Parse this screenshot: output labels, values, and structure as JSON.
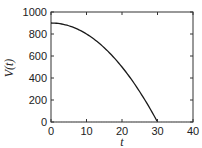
{
  "chart_data": {
    "type": "line",
    "title": "",
    "xlabel": "t",
    "ylabel": "V(t)",
    "xlim": [
      0,
      40
    ],
    "ylim": [
      0,
      1000
    ],
    "x_ticks": [
      0,
      10,
      20,
      30,
      40
    ],
    "y_ticks": [
      0,
      200,
      400,
      600,
      800,
      1000
    ],
    "grid": false,
    "legend": null,
    "series": [
      {
        "name": "V(t)",
        "color": "#1a1a1a",
        "x": [
          0,
          5,
          10,
          15,
          20,
          25,
          30
        ],
        "values": [
          900,
          875,
          800,
          675,
          500,
          275,
          0
        ]
      },
      {
        "name": "zero baseline",
        "style": "dotted",
        "color": "#888888",
        "x": [
          0,
          40
        ],
        "values": [
          0,
          0
        ]
      }
    ]
  }
}
